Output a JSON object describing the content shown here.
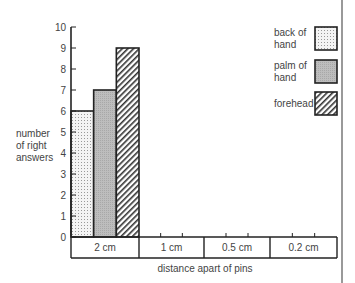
{
  "chart_data": {
    "type": "bar",
    "title": "",
    "xlabel": "distance apart of pins",
    "ylabel": "number of right answers",
    "ylabel_lines": [
      "number",
      "of right",
      "answers"
    ],
    "categories": [
      "2 cm",
      "1 cm",
      "0.5 cm",
      "0.2 cm"
    ],
    "series": [
      {
        "name": "back of hand",
        "values": [
          6,
          null,
          null,
          null
        ],
        "pattern": "dots"
      },
      {
        "name": "palm of hand",
        "values": [
          7,
          null,
          null,
          null
        ],
        "pattern": "grey"
      },
      {
        "name": "forehead",
        "values": [
          9,
          null,
          null,
          null
        ],
        "pattern": "hatch"
      }
    ],
    "ylim": [
      0,
      10
    ],
    "yticks": [
      0,
      1,
      2,
      3,
      4,
      5,
      6,
      7,
      8,
      9,
      10
    ],
    "grid": false,
    "legend_position": "top-right"
  },
  "legend": {
    "items": [
      {
        "line1": "back of",
        "line2": "hand"
      },
      {
        "line1": "palm of",
        "line2": "hand"
      },
      {
        "line1": "forehead",
        "line2": ""
      }
    ]
  }
}
